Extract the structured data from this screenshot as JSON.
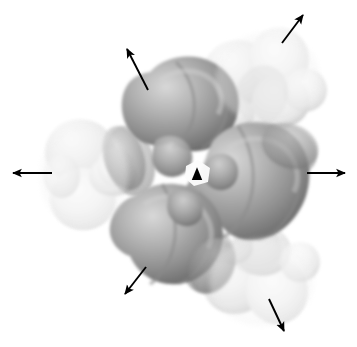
{
  "figure": {
    "caption": "",
    "width": 357,
    "height": 347,
    "background_color": "#ffffff"
  },
  "colors": {
    "background": "#ffffff",
    "lobe_dark_core": "#8e8e8e",
    "lobe_dark_mid": "#a8a8a8",
    "lobe_dark_edge": "#6f6f6f",
    "lobe_light_core": "#e6e6e6",
    "lobe_light_mid": "#f0f0f0",
    "lobe_light_edge": "#d2d2d2",
    "arrow_color": "#000000",
    "marker_color": "#000000"
  },
  "center_marker": {
    "name": "c3-axis-triangle",
    "shape": "triangle",
    "x": 197,
    "y": 174,
    "size": 11,
    "color": "#000000"
  },
  "arrows": [
    {
      "label": "left-arrow",
      "x1": 52,
      "y1": 173,
      "x2": 13,
      "y2": 173
    },
    {
      "label": "right-arrow",
      "x1": 307,
      "y1": 173,
      "x2": 345,
      "y2": 173
    },
    {
      "label": "upper-left-arrow",
      "x1": 148,
      "y1": 90,
      "x2": 127,
      "y2": 49
    },
    {
      "label": "upper-right-arrow",
      "x1": 282,
      "y1": 43,
      "x2": 303,
      "y2": 15
    },
    {
      "label": "lower-left-arrow",
      "x1": 146,
      "y1": 267,
      "x2": 125,
      "y2": 294
    },
    {
      "label": "lower-right-arrow",
      "x1": 269,
      "y1": 299,
      "x2": 284,
      "y2": 331
    }
  ],
  "dark_lobes": [
    {
      "label": "top-lobe",
      "cx": 178,
      "cy": 112,
      "rx": 62,
      "ry": 54,
      "rotation": -12
    },
    {
      "label": "right-lobe",
      "cx": 253,
      "cy": 192,
      "rx": 62,
      "ry": 60,
      "rotation": 18
    },
    {
      "label": "bottom-left-lobe",
      "cx": 172,
      "cy": 228,
      "rx": 64,
      "ry": 54,
      "rotation": 8
    },
    {
      "label": "top-inner-lobe",
      "cx": 190,
      "cy": 150,
      "rx": 36,
      "ry": 32,
      "rotation": 0
    },
    {
      "label": "right-satellite",
      "cx": 285,
      "cy": 150,
      "rx": 30,
      "ry": 24,
      "rotation": 20
    },
    {
      "label": "left-satellite",
      "cx": 129,
      "cy": 162,
      "rx": 23,
      "ry": 34,
      "rotation": -15
    },
    {
      "label": "bottom-satellite",
      "cx": 208,
      "cy": 262,
      "rx": 24,
      "ry": 30,
      "rotation": 22
    }
  ],
  "light_lobes": [
    {
      "label": "left-outer-upper",
      "cx": 80,
      "cy": 152,
      "rx": 34,
      "ry": 32
    },
    {
      "label": "left-outer-lower",
      "cx": 82,
      "cy": 198,
      "rx": 32,
      "ry": 30
    },
    {
      "label": "upper-right-outer-a",
      "cx": 238,
      "cy": 72,
      "rx": 34,
      "ry": 32
    },
    {
      "label": "upper-right-outer-b",
      "cx": 278,
      "cy": 60,
      "rx": 30,
      "ry": 32
    },
    {
      "label": "upper-right-outer-c",
      "cx": 280,
      "cy": 100,
      "rx": 28,
      "ry": 26
    },
    {
      "label": "lower-right-outer-a",
      "cx": 235,
      "cy": 282,
      "rx": 32,
      "ry": 30
    },
    {
      "label": "lower-right-outer-b",
      "cx": 276,
      "cy": 290,
      "rx": 30,
      "ry": 32
    },
    {
      "label": "lower-right-outer-c",
      "cx": 262,
      "cy": 252,
      "rx": 26,
      "ry": 24
    },
    {
      "label": "left-bridge",
      "cx": 112,
      "cy": 176,
      "rx": 22,
      "ry": 20
    },
    {
      "label": "upper-bridge",
      "cx": 222,
      "cy": 110,
      "rx": 22,
      "ry": 20
    },
    {
      "label": "lower-bridge",
      "cx": 222,
      "cy": 243,
      "rx": 22,
      "ry": 20
    }
  ]
}
